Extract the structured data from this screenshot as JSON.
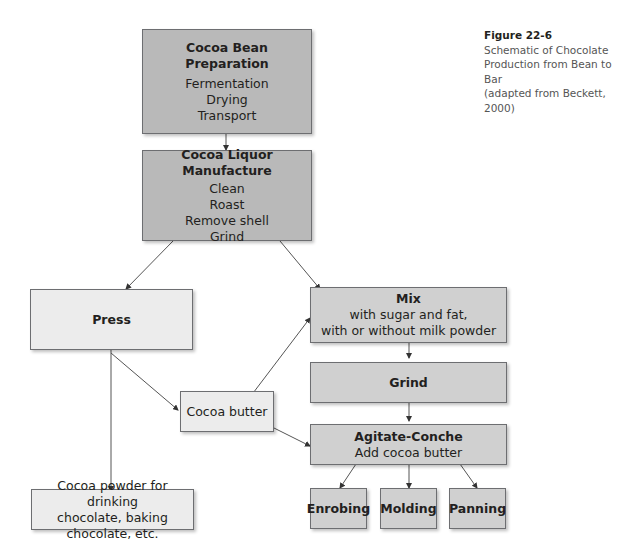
{
  "caption": {
    "figure_label": "Figure 22-6",
    "lines": [
      "Schematic of Chocolate",
      "Production from Bean to Bar",
      "(adapted from Beckett, 2000)"
    ]
  },
  "nodes": {
    "bean_prep": {
      "title": "Cocoa Bean Preparation",
      "lines": [
        "Fermentation",
        "Drying",
        "Transport"
      ]
    },
    "liquor": {
      "title": "Cocoa Liquor Manufacture",
      "lines": [
        "Clean",
        "Roast",
        "Remove shell",
        "Grind"
      ]
    },
    "press": {
      "title": "Press"
    },
    "mix": {
      "title": "Mix",
      "lines": [
        "with sugar and fat,",
        "with or without milk powder"
      ]
    },
    "grind": {
      "title": "Grind"
    },
    "cocoa_butter": {
      "label": "Cocoa butter"
    },
    "conche": {
      "title": "Agitate-Conche",
      "lines": [
        "Add cocoa butter"
      ]
    },
    "cocoa_powder": {
      "lines": [
        "Cocoa powder for drinking",
        "chocolate, baking chocolate, etc."
      ]
    },
    "enrobing": {
      "title": "Enrobing"
    },
    "molding": {
      "title": "Molding"
    },
    "panning": {
      "title": "Panning"
    }
  },
  "colors": {
    "dark_fill": "#b9b9b9",
    "mid_fill": "#d0d0d0",
    "light_fill": "#ececec",
    "stroke": "#6d6e71"
  }
}
